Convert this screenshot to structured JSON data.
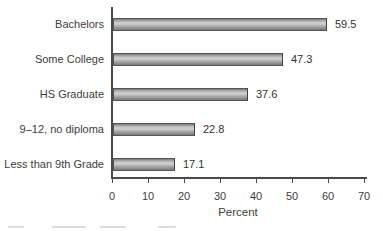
{
  "chart_data": {
    "type": "bar",
    "orientation": "horizontal",
    "categories": [
      "Bachelors",
      "Some College",
      "HS Graduate",
      "9–12, no diploma",
      "Less than 9th Grade"
    ],
    "values": [
      59.5,
      47.3,
      37.6,
      22.8,
      17.1
    ],
    "value_labels": [
      "59.5",
      "47.3",
      "37.6",
      "22.8",
      "17.1"
    ],
    "title": "",
    "xlabel": "Percent",
    "ylabel": "",
    "xlim": [
      0,
      70
    ],
    "x_ticks": [
      0,
      10,
      20,
      30,
      40,
      50,
      60,
      70
    ],
    "grid": false,
    "legend": false,
    "colors": {
      "bar_fill_light": "#cecece",
      "bar_fill_dark": "#787878",
      "bar_border": "#565656",
      "axis": "#4a4a4a",
      "text": "#3d3d3d",
      "background": "#ffffff"
    }
  },
  "layout": {
    "plot_left_px": 112,
    "plot_right_px": 364,
    "bar_height_px": 13,
    "first_bar_top_px": 18,
    "bar_step_px": 35,
    "axis_bottom_px": 177
  }
}
